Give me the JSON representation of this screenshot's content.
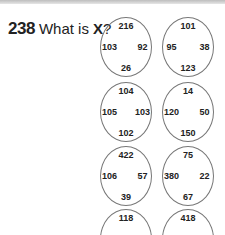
{
  "question": {
    "number": "238",
    "text_before": "What is ",
    "variable": "X",
    "text_after": "?"
  },
  "circles": [
    {
      "top": "216",
      "left": "103",
      "right": "92",
      "bottom": "26"
    },
    {
      "top": "101",
      "left": "95",
      "right": "38",
      "bottom": "123"
    },
    {
      "top": "104",
      "left": "105",
      "right": "103",
      "bottom": "102"
    },
    {
      "top": "14",
      "left": "120",
      "right": "50",
      "bottom": "150"
    },
    {
      "top": "422",
      "left": "106",
      "right": "57",
      "bottom": "39"
    },
    {
      "top": "75",
      "left": "380",
      "right": "22",
      "bottom": "67"
    },
    {
      "top": "118",
      "left": "972",
      "right": "45",
      "bottom": ""
    },
    {
      "top": "418",
      "left": "513",
      "right": "313",
      "bottom": ""
    }
  ]
}
